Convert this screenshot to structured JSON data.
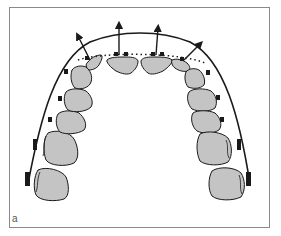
{
  "figure": {
    "panel_label": "a",
    "colors": {
      "tooth_fill": "#c4c4c4",
      "outline": "#1a1a1a",
      "frame": "#8a8a8a",
      "background": "#ffffff"
    },
    "elements": {
      "archwire": "outer archwire",
      "dotted_line": "original incisor position",
      "arrows": 4,
      "brackets": "molar tubes and brackets"
    }
  }
}
